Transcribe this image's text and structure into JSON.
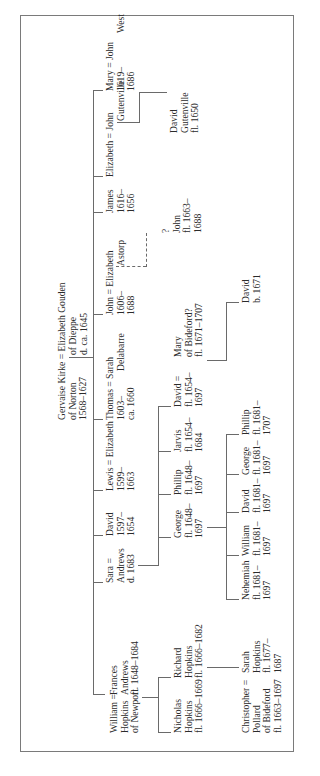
{
  "chart": {
    "orientation": "rotated-counterclockwise",
    "people": {
      "gervaise": [
        "Gervaise Kirke = Elizabeth Gouden",
        "of Norton",
        "1568–1627"
      ],
      "elizabeth_gouden": [
        "of Dieppe",
        "d. ca. 1645"
      ],
      "william_hopkins": [
        "William =",
        "Hopkins",
        "of Newport"
      ],
      "frances": [
        "Frances",
        "Andrews",
        "fl. 1648–1684"
      ],
      "sara": [
        "Sara =",
        "Andrews",
        "d. 1683"
      ],
      "david_1597": [
        "David",
        "1597–",
        "1654"
      ],
      "lewis": [
        "Lewis = Elizabeth",
        "1599–",
        "1663"
      ],
      "thomas": [
        "Thomas = Sarah",
        "1603–",
        "ca. 1660"
      ],
      "sarah_delabarre": [
        "Delabarre"
      ],
      "john_1606": [
        "John = Elizabeth",
        "1606–",
        "1688"
      ],
      "elizabeth_astorp": [
        "Astorp"
      ],
      "james": [
        "James",
        "1616–",
        "1656"
      ],
      "elizabeth_g": [
        "Elizabeth = John"
      ],
      "john_gutenville": [
        "Gutenville"
      ],
      "mary_1619": [
        "Mary = John",
        "1619–",
        "1686"
      ],
      "john_west": [
        "West"
      ],
      "david_gutenville": [
        "David",
        "Gutenville",
        "fl. 1650"
      ],
      "john_1663": [
        "?",
        "John",
        "fl. 1663–",
        "1688"
      ],
      "nicholas": [
        "Nicholas",
        "Hopkins",
        "fl. 1666–1669"
      ],
      "richard": [
        "Richard",
        "Hopkins",
        "fl. 1666–1682"
      ],
      "george_1648": [
        "George",
        "fl. 1648–",
        "1697"
      ],
      "phillip_1648": [
        "Phillip",
        "fl. 1648–",
        "1697"
      ],
      "jarvis": [
        "Jarvis",
        "fl. 1654–",
        "1684"
      ],
      "david_1654": [
        "David =",
        "fl. 1654–",
        "1697"
      ],
      "mary_bideford": [
        "Mary",
        "of Bideford?",
        "fl. 1671–1707"
      ],
      "christopher": [
        "Christopher =",
        "Pollard",
        "of Bideford",
        "fl. 1663–1697"
      ],
      "sarah_hopkins": [
        "Sarah",
        "Hopkins",
        "fl. 1677–",
        "1687"
      ],
      "nehemiah": [
        "Nehemiah",
        "fl. 1681–",
        "1697"
      ],
      "william_1681": [
        "William",
        "fl. 1681–",
        "1697"
      ],
      "david_1681": [
        "David",
        "fl. 1681–",
        "1697"
      ],
      "george_1681": [
        "George",
        "fl. 1681–",
        "1697"
      ],
      "phillip_1681": [
        "Phillip",
        "fl. 1681–",
        "1707"
      ],
      "david_1671": [
        "David",
        "b. 1671"
      ]
    }
  },
  "caption": ""
}
